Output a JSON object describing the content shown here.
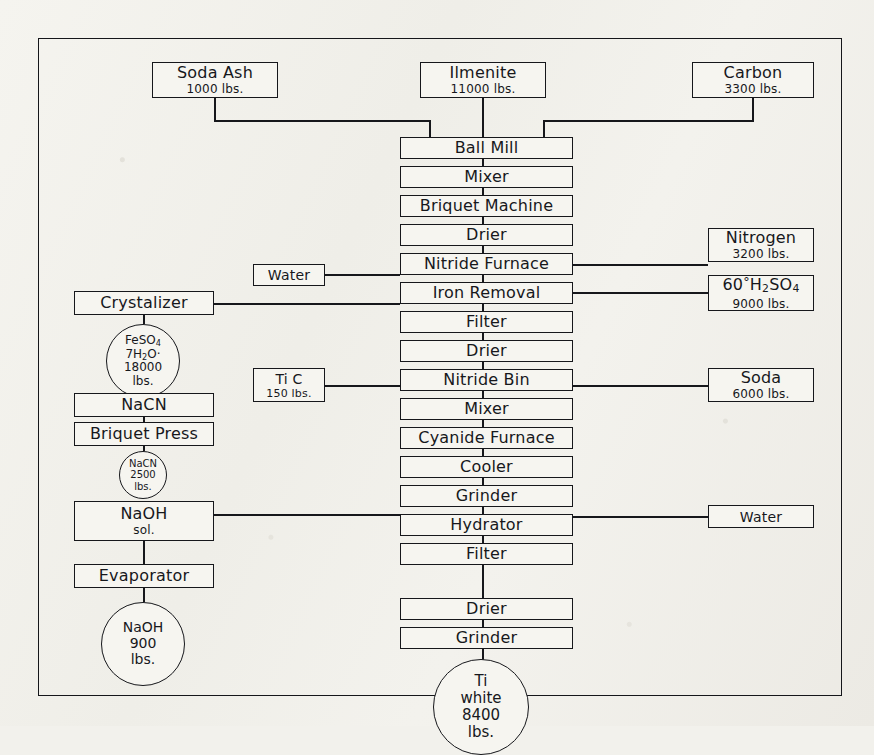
{
  "diagram": {
    "frame_color": "#16171b",
    "paper_color": "#f2f1ec"
  },
  "inputs_top": {
    "soda_ash": {
      "name": "Soda Ash",
      "qty": "1000 lbs."
    },
    "ilmenite": {
      "name": "Ilmenite",
      "qty": "11000 lbs."
    },
    "carbon": {
      "name": "Carbon",
      "qty": "3300 lbs."
    }
  },
  "process_column": [
    {
      "label": "Ball Mill"
    },
    {
      "label": "Mixer"
    },
    {
      "label": "Briquet Machine"
    },
    {
      "label": "Drier"
    },
    {
      "label": "Nitride Furnace"
    },
    {
      "label": "Iron Removal"
    },
    {
      "label": "Filter"
    },
    {
      "label": "Drier"
    },
    {
      "label": "Nitride Bin"
    },
    {
      "label": "Mixer"
    },
    {
      "label": "Cyanide Furnace"
    },
    {
      "label": "Cooler"
    },
    {
      "label": "Grinder"
    },
    {
      "label": "Hydrator"
    },
    {
      "label": "Filter"
    },
    {
      "label": "Drier"
    },
    {
      "label": "Grinder"
    }
  ],
  "inputs_left": {
    "water": {
      "name": "Water"
    },
    "ti_c": {
      "name": "Ti C",
      "qty": "150 lbs."
    }
  },
  "inputs_right": {
    "nitrogen": {
      "name": "Nitrogen",
      "qty": "3200 lbs."
    },
    "sulfuric": {
      "name_pre": "60",
      "name_mid": "H",
      "sub1": "2",
      "name_mid2": "SO",
      "sub2": "4",
      "qty": "9000 lbs.",
      "plain": "60°H2SO4"
    },
    "soda": {
      "name": "Soda",
      "qty": "6000 lbs."
    },
    "water": {
      "name": "Water"
    }
  },
  "left_branch": {
    "crystalizer": {
      "label": "Crystalizer"
    },
    "feso4_circle": {
      "line1": "FeSO",
      "sub1": "4",
      "line2_a": "7H",
      "sub2": "2",
      "line2_b": "O·",
      "line3": "18000",
      "line4": "lbs."
    },
    "nacn_box": {
      "label": "NaCN"
    },
    "briquet_press": {
      "label": "Briquet Press"
    },
    "nacn_circle": {
      "line1": "NaCN",
      "line2": "2500",
      "line3": "lbs."
    },
    "naoh_sol": {
      "line1": "NaOH",
      "line2": "sol."
    },
    "evaporator": {
      "label": "Evaporator"
    },
    "naoh_circle": {
      "line1": "NaOH",
      "line2": "900",
      "line3": "lbs."
    }
  },
  "product": {
    "line1": "Ti",
    "line2": "white",
    "line3": "8400",
    "line4": "lbs."
  }
}
